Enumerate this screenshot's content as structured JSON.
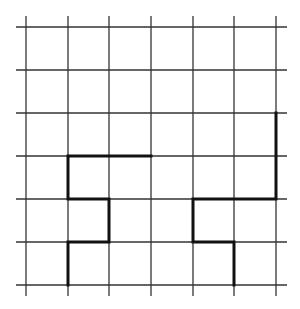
{
  "diagram": {
    "type": "grid-with-paths",
    "grid": {
      "columns": 6,
      "rows": 6,
      "vertical_lines_x": [
        26,
        68,
        109,
        151,
        193,
        234,
        276
      ],
      "horizontal_lines_y": [
        27,
        70,
        113,
        156,
        199,
        242,
        285
      ],
      "line_color": "#333333",
      "line_extent": {
        "x_min": 16,
        "x_max": 287,
        "y_min": 16,
        "y_max": 296
      }
    },
    "paths": [
      {
        "name": "left-staircase-path",
        "grid_points": [
          [
            3,
            3
          ],
          [
            1,
            3
          ],
          [
            1,
            4
          ],
          [
            2,
            4
          ],
          [
            2,
            5
          ],
          [
            1,
            5
          ],
          [
            1,
            6
          ]
        ],
        "color": "#111111"
      },
      {
        "name": "right-staircase-path",
        "grid_points": [
          [
            6,
            2
          ],
          [
            6,
            4
          ],
          [
            4,
            4
          ],
          [
            4,
            5
          ],
          [
            5,
            5
          ],
          [
            5,
            6
          ]
        ],
        "color": "#111111"
      }
    ]
  }
}
